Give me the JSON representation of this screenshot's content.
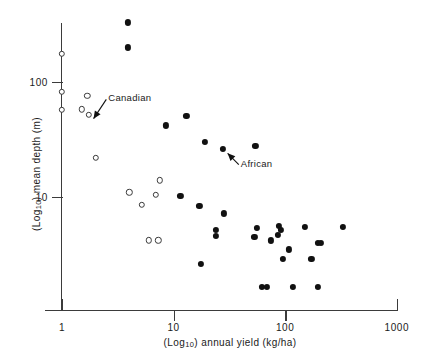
{
  "chart_data": {
    "type": "scatter",
    "title": "",
    "xlabel": "(Log10) annual yield (kg/ha)",
    "ylabel": "(Log10) mean depth (m)",
    "xlabel_parts": {
      "prefix": "(Log",
      "sub": "10",
      "suffix": ") annual yield (kg/ha)"
    },
    "ylabel_parts": {
      "prefix": "(Log",
      "sub": "10",
      "suffix": ") mean depth (m)"
    },
    "xscale": "log",
    "yscale": "log",
    "xlim": [
      1,
      1000
    ],
    "ylim": [
      1.6,
      420
    ],
    "grid": false,
    "legend": "none",
    "xticks": [
      1,
      10,
      100,
      1000
    ],
    "xticklabels": [
      "1",
      "10",
      "100",
      "1000"
    ],
    "yticks": [
      10,
      100
    ],
    "yticklabels": [
      "10",
      "100"
    ],
    "series": [
      {
        "name": "open-circles",
        "marker": "open circle",
        "color": "#3a3a3a",
        "points": [
          {
            "x": 1.0,
            "y": 175
          },
          {
            "x": 1.0,
            "y": 82
          },
          {
            "x": 1.0,
            "y": 57
          },
          {
            "x": 1.68,
            "y": 76
          },
          {
            "x": 1.5,
            "y": 58
          },
          {
            "x": 1.73,
            "y": 52
          },
          {
            "x": 2.0,
            "y": 22
          },
          {
            "x": 7.5,
            "y": 14
          },
          {
            "x": 4.0,
            "y": 11
          },
          {
            "x": 6.9,
            "y": 10.5
          },
          {
            "x": 5.2,
            "y": 8.6
          },
          {
            "x": 6.0,
            "y": 4.2
          },
          {
            "x": 7.3,
            "y": 4.2
          }
        ]
      },
      {
        "name": "filled-circles",
        "marker": "filled circle",
        "color": "#111111",
        "points": [
          {
            "x": 3.9,
            "y": 330
          },
          {
            "x": 3.9,
            "y": 200
          },
          {
            "x": 8.6,
            "y": 42
          },
          {
            "x": 13.0,
            "y": 51
          },
          {
            "x": 19.0,
            "y": 30
          },
          {
            "x": 27.5,
            "y": 26
          },
          {
            "x": 54.0,
            "y": 28
          },
          {
            "x": 11.5,
            "y": 10.3
          },
          {
            "x": 17.0,
            "y": 8.4
          },
          {
            "x": 28.0,
            "y": 7.2
          },
          {
            "x": 24.0,
            "y": 5.2
          },
          {
            "x": 24.0,
            "y": 4.6
          },
          {
            "x": 17.5,
            "y": 2.6
          },
          {
            "x": 56.0,
            "y": 5.4
          },
          {
            "x": 53.0,
            "y": 4.5
          },
          {
            "x": 75.0,
            "y": 4.2
          },
          {
            "x": 88.0,
            "y": 5.6
          },
          {
            "x": 92.0,
            "y": 5.2
          },
          {
            "x": 86.0,
            "y": 4.7
          },
          {
            "x": 108.0,
            "y": 3.5
          },
          {
            "x": 95.0,
            "y": 2.9
          },
          {
            "x": 150.0,
            "y": 5.5
          },
          {
            "x": 195.0,
            "y": 4.0
          },
          {
            "x": 210.0,
            "y": 4.0
          },
          {
            "x": 172.0,
            "y": 2.9
          },
          {
            "x": 330.0,
            "y": 5.5
          },
          {
            "x": 62.0,
            "y": 1.65
          },
          {
            "x": 68.0,
            "y": 1.65
          },
          {
            "x": 118.0,
            "y": 1.65
          },
          {
            "x": 195.0,
            "y": 1.65
          }
        ]
      }
    ],
    "annotations": [
      {
        "text": "Canadian",
        "target_x": 1.73,
        "target_y": 52,
        "label_x": 2.6,
        "label_y": 72
      },
      {
        "text": "African",
        "target_x": 27.5,
        "target_y": 26,
        "label_x": 40.0,
        "label_y": 19.5
      }
    ]
  }
}
